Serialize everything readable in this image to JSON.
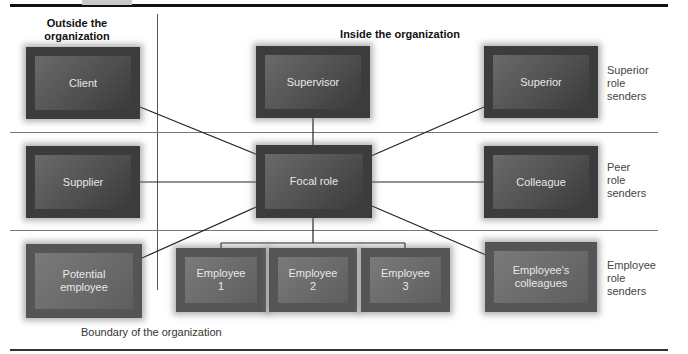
{
  "header": {
    "outside": "Outside the\norganization",
    "inside": "Inside the organization"
  },
  "nodes": {
    "client": "Client",
    "supervisor": "Supervisor",
    "superior": "Superior",
    "supplier": "Supplier",
    "focal_role": "Focal role",
    "colleague": "Colleague",
    "potential_employee": "Potential\nemployee",
    "employee1": "Employee\n1",
    "employee2": "Employee\n2",
    "employee3": "Employee\n3",
    "employees_colleagues": "Employee's\ncolleagues"
  },
  "row_labels": {
    "superior": "Superior\nrole\nsenders",
    "peer": "Peer\nrole\nsenders",
    "employee": "Employee\nrole\nsenders"
  },
  "footer": {
    "boundary": "Boundary of the organization"
  },
  "colors": {
    "box_outer": "#3c3c3c",
    "box_inner": "#5a5a5a",
    "box_text": "#e8e8e8",
    "lines": "#222222"
  }
}
